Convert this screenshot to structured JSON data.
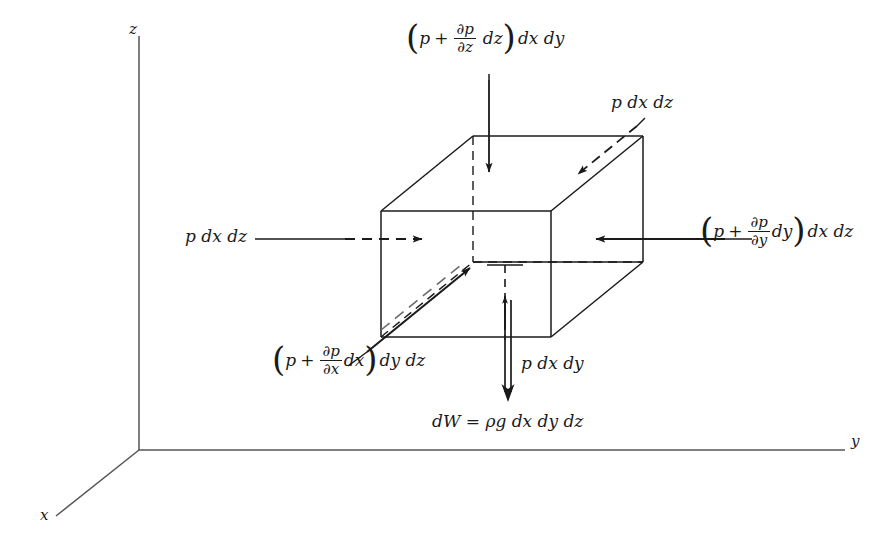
{
  "figure": {
    "background_color": "#ffffff",
    "line_color": "#1a1a1a"
  },
  "axes": {
    "origin_label": "",
    "z": {
      "label": "z"
    },
    "y": {
      "label": "y"
    },
    "x": {
      "label": "x"
    }
  },
  "labels": {
    "top_force": {
      "open": "(",
      "p": "p",
      "plus": "+",
      "num": "∂p",
      "den": "∂z",
      "diff": "dz",
      "close": ")",
      "tail": "dx dy"
    },
    "right_force": {
      "open": "(",
      "p": "p",
      "plus": "+",
      "num": "∂p",
      "den": "∂y",
      "diff": "dy",
      "close": ")",
      "tail": "dx dz"
    },
    "front_force": {
      "open": "(",
      "p": "p",
      "plus": "+",
      "num": "∂p",
      "den": "∂x",
      "diff": "dx",
      "close": ")",
      "tail": "dy dz"
    },
    "left_force": {
      "text": "p dx dz"
    },
    "back_force": {
      "text": "p dx dz"
    },
    "bottom_force": {
      "text": "p dx dy"
    },
    "weight": {
      "text": "dW = ρg dx dy dz"
    }
  }
}
